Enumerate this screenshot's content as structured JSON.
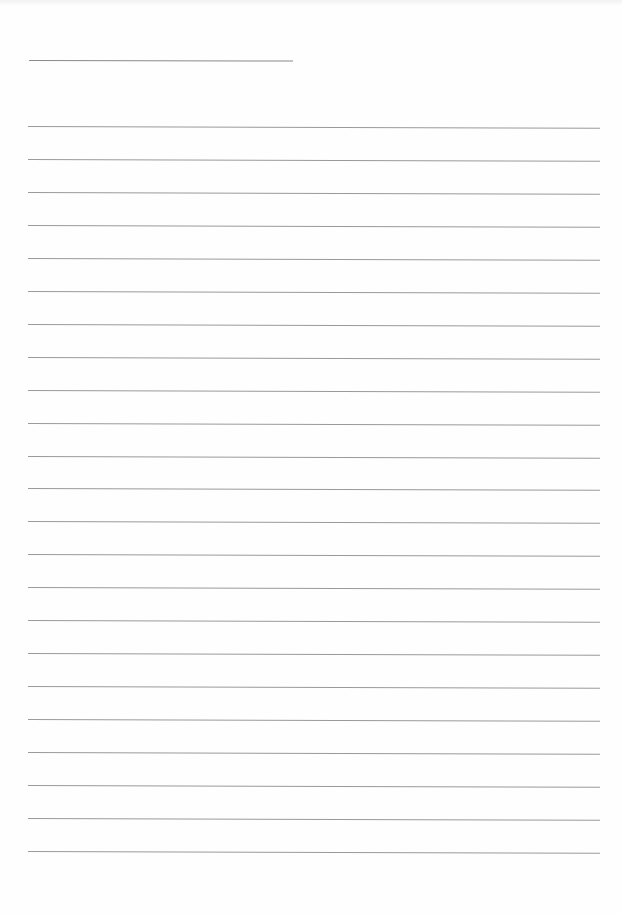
{
  "page": {
    "type": "lined-paper",
    "background_color": "#ffffff",
    "line_color": "#9a9a9a",
    "title_line": {
      "left": 29,
      "top": 60,
      "width": 264
    },
    "rules": {
      "count": 23,
      "left": 28,
      "width": 572,
      "first_top": 126,
      "spacing": 32.95
    }
  }
}
